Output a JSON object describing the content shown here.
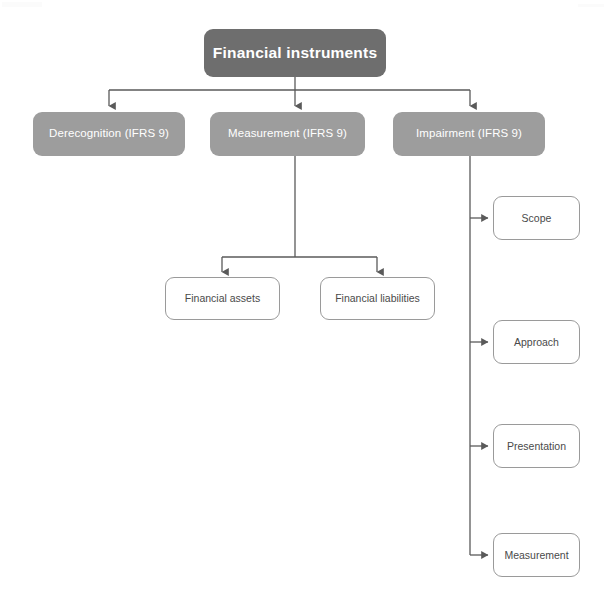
{
  "diagram": {
    "type": "hierarchy-tree",
    "colors": {
      "root_fill": "#6e6e6e",
      "level2_fill": "#9d9d9d",
      "leaf_fill": "#ffffff",
      "leaf_border": "#9a9a9a",
      "connector": "#5a5a5a",
      "root_text": "#ffffff",
      "level2_text": "#ffffff",
      "leaf_text": "#4a4a4a",
      "background": "#ffffff"
    },
    "root": {
      "label": "Financial instruments"
    },
    "level2": [
      {
        "label": "Derecognition (IFRS 9)"
      },
      {
        "label": "Measurement (IFRS 9)"
      },
      {
        "label": "Impairment (IFRS 9)"
      }
    ],
    "measurement_children": [
      {
        "label": "Financial assets"
      },
      {
        "label": "Financial liabilities"
      }
    ],
    "impairment_children": [
      {
        "label": "Scope"
      },
      {
        "label": "Approach"
      },
      {
        "label": "Presentation"
      },
      {
        "label": "Measurement"
      }
    ]
  }
}
